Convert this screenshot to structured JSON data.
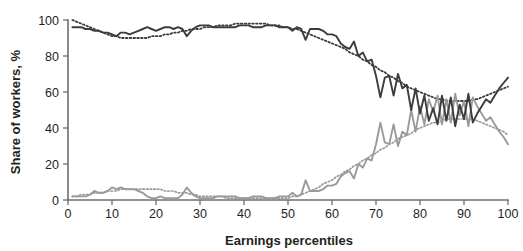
{
  "chart_data": {
    "type": "line",
    "title": "",
    "subtitle": "",
    "xlabel": "Earnings percentiles",
    "ylabel": "Share of workers, %",
    "xlim": [
      0,
      100
    ],
    "ylim": [
      0,
      100
    ],
    "xticks": [
      0,
      10,
      20,
      30,
      40,
      50,
      60,
      70,
      80,
      90,
      100
    ],
    "xticklabels": [
      "0",
      "10",
      "20",
      "30",
      "40",
      "50",
      "60",
      "70",
      "80",
      "90",
      "100"
    ],
    "yticks": [
      0,
      20,
      40,
      60,
      80,
      100
    ],
    "yticklabels": [
      "0",
      "20",
      "40",
      "60",
      "80",
      "100"
    ],
    "grid": false,
    "legend": "none",
    "colors": {
      "dark_series": "#3c3c3c",
      "light_series": "#9a9a9a",
      "axis": "#6d6e71",
      "text": "#231f20",
      "background": "#ffffff"
    },
    "x": [
      1,
      2,
      3,
      4,
      5,
      6,
      7,
      8,
      9,
      10,
      11,
      12,
      13,
      14,
      15,
      16,
      17,
      18,
      19,
      20,
      21,
      22,
      23,
      24,
      25,
      26,
      27,
      28,
      29,
      30,
      31,
      32,
      33,
      34,
      35,
      36,
      37,
      38,
      39,
      40,
      41,
      42,
      43,
      44,
      45,
      46,
      47,
      48,
      49,
      50,
      51,
      52,
      53,
      54,
      55,
      56,
      57,
      58,
      59,
      60,
      61,
      62,
      63,
      64,
      65,
      66,
      67,
      68,
      69,
      70,
      71,
      72,
      73,
      74,
      75,
      76,
      77,
      78,
      79,
      80,
      81,
      82,
      83,
      84,
      85,
      86,
      87,
      88,
      89,
      90,
      91,
      92,
      93,
      94,
      95,
      96,
      97,
      98,
      99,
      100
    ],
    "series": [
      {
        "name": "Share of workers, dark series (observed)",
        "style": "solid",
        "color": "#3c3c3c",
        "values": [
          96,
          96,
          96,
          95,
          95,
          94,
          94,
          93,
          93,
          92,
          91,
          93,
          93,
          92,
          93,
          94,
          95,
          96,
          95,
          94,
          95,
          96,
          96,
          95,
          96,
          95,
          91,
          94,
          96,
          97,
          97,
          97,
          96,
          96,
          96,
          96,
          96,
          96,
          97,
          97,
          97,
          96,
          96,
          96,
          97,
          97,
          97,
          96,
          96,
          96,
          94,
          96,
          95,
          89,
          95,
          95,
          95,
          94,
          92,
          92,
          91,
          87,
          85,
          84,
          88,
          80,
          82,
          77,
          78,
          69,
          57,
          68,
          69,
          58,
          70,
          62,
          64,
          50,
          62,
          48,
          58,
          44,
          51,
          42,
          58,
          44,
          57,
          41,
          53,
          45,
          59,
          43,
          48,
          52,
          56,
          54,
          58,
          62,
          65,
          68
        ]
      },
      {
        "name": "Share of workers, dark series (trend)",
        "style": "dotted",
        "color": "#3c3c3c",
        "values": [
          100,
          99,
          98,
          97,
          96,
          95,
          94,
          93,
          92,
          91,
          91,
          90,
          90,
          90,
          90,
          90,
          90,
          90,
          91,
          91,
          91,
          92,
          92,
          93,
          93,
          94,
          94,
          95,
          95,
          95,
          96,
          96,
          96,
          97,
          97,
          97,
          97,
          98,
          98,
          98,
          98,
          98,
          98,
          98,
          98,
          97,
          97,
          97,
          96,
          96,
          95,
          95,
          94,
          93,
          92,
          91,
          90,
          89,
          88,
          87,
          86,
          85,
          84,
          82,
          81,
          80,
          78,
          77,
          75,
          74,
          72,
          71,
          69,
          68,
          66,
          65,
          63,
          62,
          61,
          60,
          59,
          58,
          57,
          56,
          56,
          55,
          55,
          55,
          55,
          55,
          55,
          56,
          56,
          57,
          58,
          59,
          60,
          61,
          62,
          63
        ]
      },
      {
        "name": "Share of workers, light series (observed)",
        "style": "solid",
        "color": "#9a9a9a",
        "values": [
          2,
          2,
          2,
          2,
          3,
          5,
          4,
          4,
          5,
          7,
          6,
          7,
          6,
          6,
          6,
          5,
          4,
          2,
          1,
          1,
          2,
          1,
          1,
          1,
          1,
          3,
          7,
          4,
          2,
          1,
          1,
          1,
          1,
          2,
          2,
          2,
          2,
          2,
          1,
          1,
          1,
          2,
          2,
          2,
          1,
          1,
          1,
          2,
          2,
          2,
          4,
          2,
          3,
          11,
          5,
          5,
          5,
          6,
          8,
          8,
          9,
          13,
          15,
          16,
          12,
          20,
          18,
          23,
          22,
          31,
          43,
          32,
          31,
          42,
          30,
          38,
          36,
          50,
          38,
          52,
          42,
          56,
          49,
          58,
          42,
          56,
          43,
          59,
          47,
          55,
          41,
          57,
          52,
          48,
          44,
          46,
          42,
          38,
          35,
          31
        ]
      },
      {
        "name": "Share of workers, light series (trend)",
        "style": "dotted",
        "color": "#9a9a9a",
        "values": [
          2,
          2,
          3,
          3,
          3,
          4,
          4,
          4,
          5,
          5,
          5,
          6,
          6,
          6,
          6,
          6,
          6,
          6,
          6,
          6,
          6,
          5,
          5,
          5,
          4,
          4,
          4,
          3,
          3,
          2,
          2,
          2,
          2,
          2,
          2,
          1,
          1,
          1,
          1,
          1,
          1,
          1,
          1,
          1,
          1,
          1,
          1,
          1,
          1,
          1,
          2,
          2,
          3,
          4,
          5,
          6,
          7,
          9,
          10,
          11,
          13,
          14,
          16,
          17,
          19,
          20,
          22,
          23,
          25,
          26,
          28,
          29,
          31,
          32,
          34,
          35,
          36,
          37,
          39,
          40,
          41,
          42,
          43,
          43,
          44,
          45,
          45,
          45,
          45,
          45,
          45,
          45,
          44,
          43,
          42,
          41,
          40,
          39,
          38,
          36
        ]
      }
    ]
  }
}
